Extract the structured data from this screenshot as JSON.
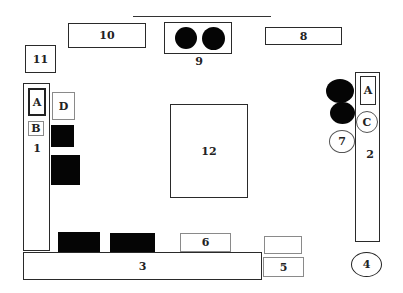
{
  "diagram": {
    "type": "floor-plan-layout",
    "colors": {
      "outline": "#2a2a2a",
      "fill_solid": "#050505",
      "background": "#ffffff"
    },
    "items": {
      "box_10": {
        "label": "10"
      },
      "box_9": {
        "label": "9",
        "circles": 2
      },
      "box_8": {
        "label": "8"
      },
      "box_11": {
        "label": "11"
      },
      "column_1": {
        "label": "1",
        "sub_a": "A",
        "sub_b": "B"
      },
      "box_d": {
        "label": "D"
      },
      "box_12": {
        "label": "12"
      },
      "column_2": {
        "label": "2",
        "sub_a": "A"
      },
      "circle_c": {
        "label": "C"
      },
      "circle_7": {
        "label": "7"
      },
      "bar_3": {
        "label": "3"
      },
      "box_6": {
        "label": "6"
      },
      "box_5": {
        "label": "5"
      },
      "circle_4": {
        "label": "4"
      }
    }
  }
}
